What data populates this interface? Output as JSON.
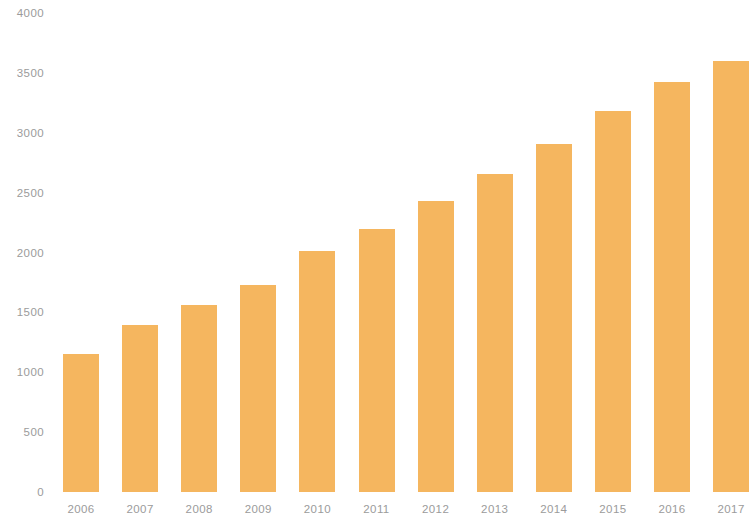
{
  "chart_data": {
    "type": "bar",
    "title": "",
    "subtitle": "",
    "xlabel": "",
    "ylabel": "",
    "categories": [
      "2006",
      "2007",
      "2008",
      "2009",
      "2010",
      "2011",
      "2012",
      "2013",
      "2014",
      "2015",
      "2016",
      "2017"
    ],
    "values": [
      1152,
      1394,
      1562,
      1729,
      2012,
      2196,
      2430,
      2656,
      2906,
      3181,
      3424,
      3599
    ],
    "ylim": [
      0,
      4000
    ],
    "y_ticks": [
      0,
      500,
      1000,
      1500,
      2000,
      2500,
      3000,
      3500,
      4000
    ],
    "y_tick_labels": [
      "0",
      "500",
      "1000",
      "1500",
      "2000",
      "2500",
      "3000",
      "3500",
      "4000"
    ],
    "grid": false,
    "legend": null,
    "legend_position": "none",
    "annotations": [],
    "series": [
      {
        "name": "",
        "values": [
          1152,
          1394,
          1562,
          1729,
          2012,
          2196,
          2430,
          2656,
          2906,
          3181,
          3424,
          3599
        ]
      }
    ],
    "colors": {
      "bar": "#f5b65f",
      "background": "#ffffff",
      "tick_label": "#9b9b9b"
    }
  }
}
